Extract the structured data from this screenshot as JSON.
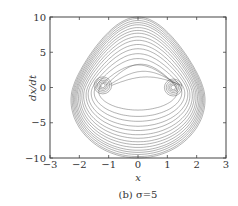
{
  "chart_data": {
    "type": "line",
    "title": "",
    "caption": "(b) σ=5",
    "xlabel": "x",
    "ylabel": "dx/dt",
    "xlim": [
      -3,
      3
    ],
    "ylim": [
      -10,
      10
    ],
    "xticks": [
      -3,
      -2,
      -1,
      0,
      1,
      2,
      3
    ],
    "yticks": [
      -10,
      -5,
      0,
      5,
      10
    ],
    "xtick_labels": [
      "−3",
      "−2",
      "−1",
      "0",
      "1",
      "2",
      "3"
    ],
    "ytick_labels": [
      "−10",
      "−5",
      "0",
      "5",
      "10"
    ],
    "grid": false,
    "legend": null,
    "parameters": {
      "sigma": 5
    },
    "series": [
      {
        "name": "trajectory",
        "color": "#555555",
        "orbit_family": {
          "amplitudes_x": [
            1.3,
            1.45,
            1.55,
            1.65,
            1.72,
            1.8,
            1.86,
            1.92,
            1.97,
            2.02,
            2.06,
            2.1,
            2.14,
            2.18,
            2.22
          ],
          "peak_velocities": [
            3.2,
            4.1,
            4.8,
            5.5,
            6.1,
            6.7,
            7.2,
            7.7,
            8.1,
            8.5,
            8.9,
            9.2,
            9.5,
            9.8,
            10.0
          ]
        },
        "foci": [
          {
            "x": -1.2,
            "y": 0.3,
            "radii": [
              0.08,
              0.13,
              0.18,
              0.24,
              0.3
            ]
          },
          {
            "x": 1.2,
            "y": 0.0,
            "radii": [
              0.08,
              0.13,
              0.18,
              0.24,
              0.3
            ]
          }
        ]
      }
    ]
  }
}
